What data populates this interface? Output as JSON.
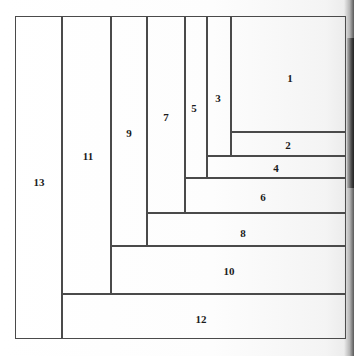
{
  "figure": {
    "frame": {
      "left": 15,
      "top": 15.5,
      "right": 346,
      "bottom": 339
    },
    "line_color": "#4a4a4a",
    "label_color": "#1b1b1b",
    "background_color": "#ffffff"
  },
  "rectangles": [
    {
      "label": "1",
      "x": 231,
      "y": 15.5,
      "w": 115,
      "h": 116.5,
      "label_x": 290,
      "label_y": 78
    },
    {
      "label": "2",
      "x": 231,
      "y": 132,
      "w": 115,
      "h": 24,
      "label_x": 288,
      "label_y": 145
    },
    {
      "label": "3",
      "x": 207,
      "y": 15.5,
      "w": 24,
      "h": 140.5,
      "label_x": 218,
      "label_y": 98
    },
    {
      "label": "4",
      "x": 207,
      "y": 156,
      "w": 139,
      "h": 21.5,
      "label_x": 276,
      "label_y": 168
    },
    {
      "label": "5",
      "x": 184.5,
      "y": 15.5,
      "w": 22.5,
      "h": 162,
      "label_x": 194,
      "label_y": 108
    },
    {
      "label": "6",
      "x": 184.5,
      "y": 177.5,
      "w": 161.5,
      "h": 35.5,
      "label_x": 263,
      "label_y": 197
    },
    {
      "label": "7",
      "x": 147,
      "y": 15.5,
      "w": 37.5,
      "h": 197.5,
      "label_x": 166,
      "label_y": 117
    },
    {
      "label": "8",
      "x": 147,
      "y": 213,
      "w": 199,
      "h": 33,
      "label_x": 243,
      "label_y": 233
    },
    {
      "label": "9",
      "x": 111,
      "y": 15.5,
      "w": 36,
      "h": 230.5,
      "label_x": 129,
      "label_y": 133
    },
    {
      "label": "10",
      "x": 111,
      "y": 246,
      "w": 235,
      "h": 47.5,
      "label_x": 229,
      "label_y": 271
    },
    {
      "label": "11",
      "x": 62,
      "y": 15.5,
      "w": 49,
      "h": 278,
      "label_x": 88,
      "label_y": 156
    },
    {
      "label": "12",
      "x": 62,
      "y": 293.5,
      "w": 284,
      "h": 45.5,
      "label_x": 201,
      "label_y": 319
    },
    {
      "label": "13",
      "x": 15,
      "y": 15.5,
      "w": 47,
      "h": 323.5,
      "label_x": 39,
      "label_y": 182
    }
  ]
}
